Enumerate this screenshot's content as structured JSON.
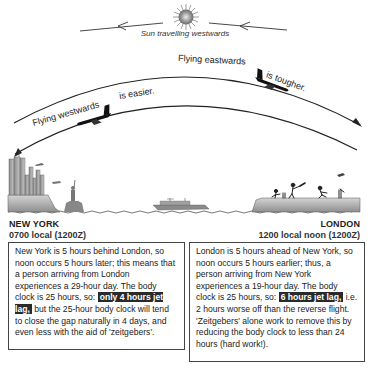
{
  "sun": {
    "icon": "sun-icon",
    "caption": "Sun travelling westwards"
  },
  "arcs": {
    "outer": {
      "direction": "eastwards",
      "label_part1": "Flying eastwards",
      "label_part2": "is tougher."
    },
    "inner": {
      "direction": "westwards",
      "label_part1": "Flying westwards",
      "label_part2": "is easier."
    }
  },
  "cities": {
    "left": {
      "name": "NEW YORK",
      "time": "0700 local (1200Z)"
    },
    "right": {
      "name": "LONDON",
      "time": "1200 local noon (1200Z)"
    }
  },
  "boxes": {
    "left": {
      "text_before": "New York is 5 hours behind London, so noon occurs 5 hours later; this means that a person arriving from London experiences a 29-hour day. The body clock is 25 hours, so:",
      "highlight": "only 4 hours jet lag,",
      "text_after": "but the 25-hour body clock will tend to close the gap naturally in 4 days, and even less with the aid of 'zeitgebers'."
    },
    "right": {
      "text_before": "London is 5 hours ahead of New York, so noon occurs 5 hours earlier; thus, a person arriving from New York experiences a 19-hour day. The body clock is 25 hours, so:",
      "highlight": "6 hours jet lag,",
      "text_after": "i.e. 2 hours worse off than the reverse flight. 'Zeitgebers' alone work to remove this by reducing the body clock to less than 24 hours (hard work!)."
    }
  },
  "colors": {
    "ink": "#222222",
    "land": "#b8b8b8",
    "highlight_bg": "#2a2a2a"
  }
}
